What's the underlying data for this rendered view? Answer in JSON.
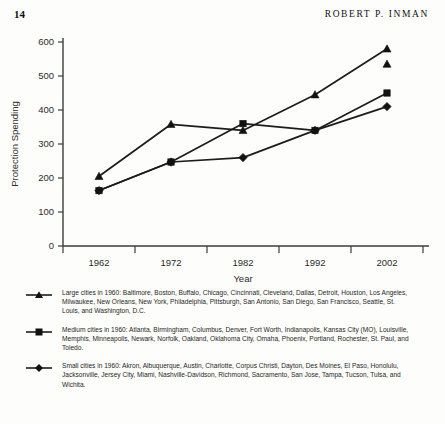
{
  "page": {
    "folio": "14",
    "running_head": "ROBERT P. INMAN"
  },
  "chart_data": {
    "type": "line",
    "title": "",
    "xlabel": "Year",
    "ylabel": "Protection Spending",
    "categories": [
      "1962",
      "1972",
      "1982",
      "1992",
      "2002"
    ],
    "x": [
      1962,
      1972,
      1982,
      1992,
      2002
    ],
    "ylim": [
      0,
      600
    ],
    "yticks": [
      0,
      100,
      200,
      300,
      400,
      500,
      600
    ],
    "grid": false,
    "legend_position": "below",
    "series": [
      {
        "name": "Large cities in 1960",
        "marker": "triangle",
        "values": [
          205,
          358,
          340,
          445,
          580
        ]
      },
      {
        "name": "Medium cities in 1960",
        "marker": "square",
        "values": [
          163,
          247,
          360,
          340,
          450
        ]
      },
      {
        "name": "Small cities in 1960",
        "marker": "diamond",
        "values": [
          163,
          247,
          260,
          340,
          410
        ]
      }
    ],
    "extra_markers": [
      {
        "series": "Large cities in 1960",
        "x": "2002",
        "y": 535,
        "marker": "triangle"
      }
    ]
  },
  "legend": {
    "entries": [
      {
        "marker": "triangle",
        "marker_name": "legend-marker-triangle",
        "text": "Large cities in 1960: Baltimore, Boston, Buffalo, Chicago, Cincinnati, Cleveland, Dallas, Detroit, Houston, Los Angeles, Milwaukee, New Orleans, New York, Philadelphia, Pittsburgh, San Antonio, San Diego, San Francisco, Seattle, St. Louis, and Washington, D.C."
      },
      {
        "marker": "square",
        "marker_name": "legend-marker-square",
        "text": "Medium cities in 1960: Atlanta, Birmingham, Columbus, Denver, Fort Worth, Indianapolis, Kansas City (MO), Louisville, Memphis, Minneapolis, Newark, Norfolk, Oakland, Oklahoma City, Omaha, Phoenix, Portland, Rochester, St. Paul, and Toledo."
      },
      {
        "marker": "diamond",
        "marker_name": "legend-marker-diamond",
        "text": "Small cities in 1960: Akron, Albuquerque, Austin, Charlotte, Corpus Christi, Dayton, Des Moines, El Paso, Honolulu, Jacksonville, Jersey City, Miami, Nashville-Davidson, Richmond, Sacramento, San Jose, Tampa, Tucson, Tulsa, and Wichita."
      }
    ]
  },
  "colors": {
    "ink": "#1c1c1c",
    "axis": "#3b3b3b",
    "paper": "#fdfdfb"
  }
}
